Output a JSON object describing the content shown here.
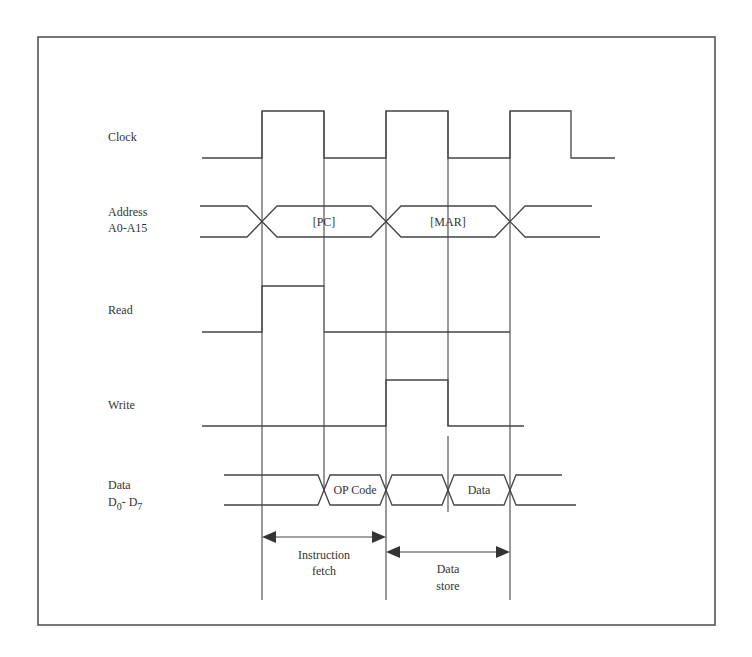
{
  "diagram": {
    "signals": [
      {
        "id": "clock",
        "label": "Clock"
      },
      {
        "id": "address",
        "label_line1": "Address",
        "label_line2": "A0-A15"
      },
      {
        "id": "read",
        "label": "Read"
      },
      {
        "id": "write",
        "label": "Write"
      },
      {
        "id": "data",
        "label_line1": "Data",
        "label_line2_main1": "D",
        "label_line2_sub1": "0",
        "label_line2_sep": "- D",
        "label_line2_sub2": "7"
      }
    ],
    "bus_values": {
      "address": [
        "[PC]",
        "[MAR]"
      ],
      "data": [
        "OP Code",
        "Data"
      ]
    },
    "phases": [
      {
        "line1": "Instruction",
        "line2": "fetch"
      },
      {
        "line1": "Data",
        "line2": "store"
      }
    ],
    "colors": {
      "line": "#444444",
      "text": "#333333",
      "frame": "#555555",
      "background": "#ffffff"
    }
  }
}
